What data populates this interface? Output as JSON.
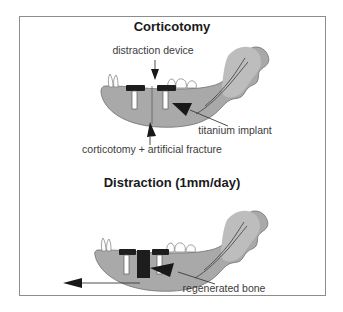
{
  "figure": {
    "border_color": "#8d8d8d",
    "background": "#ffffff",
    "bone_color": "#a9a9a9",
    "implant_color": "#1d1d1d",
    "post_color": "#ffffff",
    "text_color": "#3b3b3b"
  },
  "panels": [
    {
      "id": "corticotomy",
      "title": "Corticotomy",
      "annotations": [
        {
          "id": "distraction-device",
          "text": "distraction device"
        },
        {
          "id": "titanium-implant",
          "text": "titanium implant"
        },
        {
          "id": "corticotomy-fracture",
          "text": "corticotomy + artificial fracture"
        }
      ]
    },
    {
      "id": "distraction",
      "title": "Distraction (1mm/day)",
      "annotations": [
        {
          "id": "regenerated-bone",
          "text": "regenerated bone"
        }
      ]
    }
  ]
}
